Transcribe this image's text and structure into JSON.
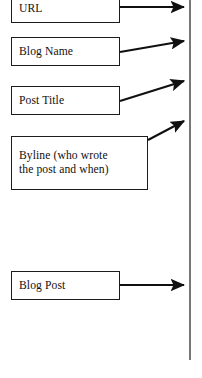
{
  "diagram": {
    "type": "annotated-callout-diagram",
    "page_edge": {
      "name": "page-edge-line",
      "orientation": "vertical",
      "x": 190,
      "y_start": 0,
      "y_end": 360,
      "color": "#555555"
    },
    "callouts": [
      {
        "id": "url",
        "label": "URL",
        "box": {
          "x": 11,
          "y": -6,
          "width": 109,
          "height": 29
        },
        "arrow": {
          "x1": 120,
          "y1": 7,
          "x2": 186,
          "y2": 7,
          "style": "straight"
        }
      },
      {
        "id": "blog-name",
        "label": "Blog Name",
        "box": {
          "x": 11,
          "y": 37,
          "width": 109,
          "height": 29
        },
        "arrow": {
          "x1": 120,
          "y1": 52,
          "x2": 186,
          "y2": 41,
          "style": "angled-up"
        }
      },
      {
        "id": "post-title",
        "label": "Post Title",
        "box": {
          "x": 11,
          "y": 86,
          "width": 109,
          "height": 29
        },
        "arrow": {
          "x1": 120,
          "y1": 101,
          "x2": 186,
          "y2": 81,
          "style": "angled-up"
        }
      },
      {
        "id": "byline",
        "label": "Byline (who wrote\nthe post and when)",
        "box": {
          "x": 11,
          "y": 136,
          "width": 137,
          "height": 54
        },
        "arrow": {
          "x1": 148,
          "y1": 140,
          "x2": 186,
          "y2": 121,
          "style": "angled-up"
        }
      },
      {
        "id": "blog-post",
        "label": "Blog Post",
        "box": {
          "x": 11,
          "y": 271,
          "width": 109,
          "height": 29
        },
        "arrow": {
          "x1": 120,
          "y1": 285,
          "x2": 186,
          "y2": 285,
          "style": "straight"
        }
      }
    ],
    "colors": {
      "box_border": "#1c1c1c",
      "box_fill": "#ffffff",
      "text": "#111111",
      "arrow": "#101010",
      "page_edge": "#555555",
      "background": "#ffffff"
    }
  }
}
